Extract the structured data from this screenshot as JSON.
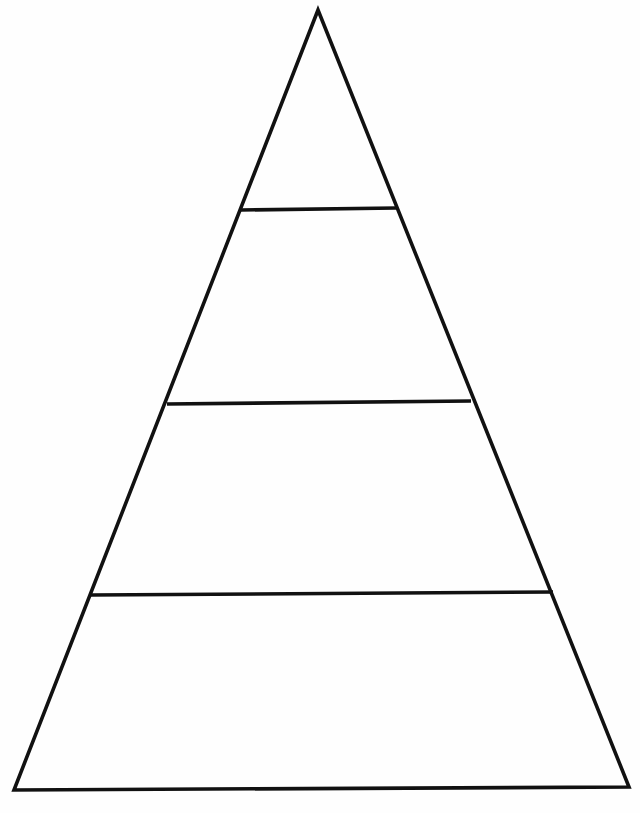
{
  "document": {
    "title": "Blank Pyramid Diagram",
    "kind": "line-drawing",
    "background_color": "#ffffff",
    "ink_color": "#111111",
    "width": 640,
    "height": 813,
    "visible_text": ""
  },
  "diagram": {
    "name": "pyramid-diagram",
    "shape": "triangle",
    "tier_count": 4,
    "stroke_color": "#111111",
    "stroke_width": 3.6,
    "fill_color": "#ffffff",
    "apex": {
      "x": 318,
      "y": 10
    },
    "base_left": {
      "x": 14,
      "y": 790
    },
    "base_right": {
      "x": 629,
      "y": 787
    },
    "outline_points": "318,10 629,787 14,790",
    "dividers": [
      {
        "name": "divider-1",
        "index": 1,
        "y": 209,
        "x1": 241,
        "y1": 210,
        "x2": 396,
        "y2": 208,
        "width": 155
      },
      {
        "name": "divider-2",
        "index": 2,
        "y": 402,
        "x1": 167,
        "y1": 404,
        "x2": 471,
        "y2": 401,
        "width": 304
      },
      {
        "name": "divider-3",
        "index": 3,
        "y": 593,
        "x1": 91,
        "y1": 595,
        "x2": 553,
        "y2": 592,
        "width": 462
      }
    ],
    "tiers": [
      {
        "name": "tier-1-apex",
        "index": 1,
        "position": "top",
        "label": "",
        "polygon": "318,10 396,208 241,210",
        "center_x": 318,
        "center_y": 150
      },
      {
        "name": "tier-2",
        "index": 2,
        "position": "upper-middle",
        "label": "",
        "polygon": "241,210 396,208 471,401 167,404",
        "center_x": 318,
        "center_y": 310
      },
      {
        "name": "tier-3",
        "index": 3,
        "position": "lower-middle",
        "label": "",
        "polygon": "167,404 471,401 553,592 91,595",
        "center_x": 320,
        "center_y": 500
      },
      {
        "name": "tier-4-base",
        "index": 4,
        "position": "bottom",
        "label": "",
        "polygon": "91,595 553,592 629,787 14,790",
        "center_x": 321,
        "center_y": 692
      }
    ]
  }
}
